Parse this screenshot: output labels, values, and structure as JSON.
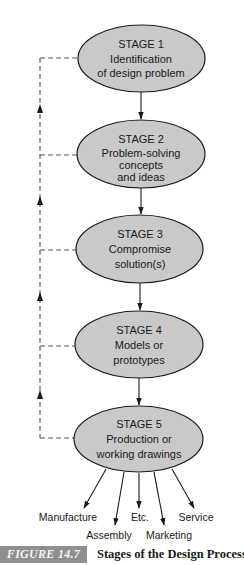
{
  "diagram": {
    "colors": {
      "ellipse_fill": "#c9c9c9",
      "stroke": "#1a1a1a",
      "dashed": "#555555",
      "caption_box": "#8f8f8f"
    },
    "stages": [
      {
        "title": "STAGE 1",
        "lines": [
          "Identification",
          "of design problem"
        ]
      },
      {
        "title": "STAGE 2",
        "lines": [
          "Problem-solving",
          "concepts",
          "and ideas"
        ]
      },
      {
        "title": "STAGE 3",
        "lines": [
          "Compromise",
          "solution(s)"
        ]
      },
      {
        "title": "STAGE 4",
        "lines": [
          "Models or",
          "prototypes"
        ]
      },
      {
        "title": "STAGE 5",
        "lines": [
          "Production or",
          "working drawings"
        ]
      }
    ],
    "outputs": [
      "Manufacture",
      "Assembly",
      "Etc.",
      "Marketing",
      "Service"
    ],
    "feedback_loop": "dashed line from each stage back to Stage 1"
  },
  "caption": {
    "label": "FIGURE 14.7",
    "text": "Stages of the Design Process."
  }
}
